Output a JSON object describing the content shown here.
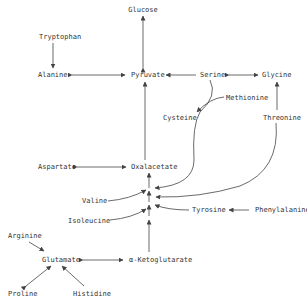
{
  "diagram": {
    "type": "metabolic-pathway",
    "colors": {
      "text": "#333333",
      "line": "#444444",
      "background": "#ffffff"
    },
    "nodes": {
      "glucose": {
        "label": "Glucose",
        "x": 143,
        "y": 6
      },
      "tryptophan": {
        "label": "Tryptophan",
        "x": 39,
        "y": 33
      },
      "alanine": {
        "label": "Alanine",
        "x": 38,
        "y": 71
      },
      "pyruvate": {
        "label": "Pyruvate",
        "x": 131,
        "y": 71
      },
      "serine": {
        "label": "Serine",
        "x": 200,
        "y": 71
      },
      "glycine": {
        "label": "Glycine",
        "x": 262,
        "y": 71
      },
      "methionine": {
        "label": "Methionine",
        "x": 226,
        "y": 94
      },
      "cysteine": {
        "label": "Cysteine",
        "x": 163,
        "y": 114
      },
      "threonine": {
        "label": "Threonine",
        "x": 263,
        "y": 114
      },
      "aspartate": {
        "label": "Aspartate",
        "x": 38,
        "y": 163
      },
      "oxalacetate": {
        "label": "Oxalacetate",
        "x": 131,
        "y": 163
      },
      "valine": {
        "label": "Valine",
        "x": 82,
        "y": 197
      },
      "isoleucine": {
        "label": "Isoleucine",
        "x": 68,
        "y": 217
      },
      "tyrosine": {
        "label": "Tyrosine",
        "x": 192,
        "y": 206
      },
      "phenylalanine": {
        "label": "Phenylalanine",
        "x": 255,
        "y": 206
      },
      "arginine": {
        "label": "Arginine",
        "x": 8,
        "y": 232
      },
      "glutamate": {
        "label": "Glutamate",
        "x": 42,
        "y": 256
      },
      "ketoglutarate": {
        "label": "α-Ketoglutarate",
        "x": 129,
        "y": 256
      },
      "proline": {
        "label": "Proline",
        "x": 8,
        "y": 290
      },
      "histidine": {
        "label": "Histidine",
        "x": 73,
        "y": 290
      }
    },
    "edges": [
      {
        "from": "pyruvate",
        "to": "glucose",
        "bidirectional": true
      },
      {
        "from": "tryptophan",
        "to": "alanine"
      },
      {
        "from": "alanine",
        "to": "pyruvate",
        "bidirectional": true
      },
      {
        "from": "serine",
        "to": "pyruvate"
      },
      {
        "from": "serine",
        "to": "glycine",
        "bidirectional": true
      },
      {
        "from": "methionine",
        "to": "cysteine"
      },
      {
        "from": "serine",
        "to": "oxalacetate-chain"
      },
      {
        "from": "threonine",
        "to": "glycine"
      },
      {
        "from": "threonine",
        "to": "oxalacetate-chain"
      },
      {
        "from": "oxalacetate",
        "to": "pyruvate"
      },
      {
        "from": "aspartate",
        "to": "oxalacetate",
        "bidirectional": true
      },
      {
        "from": "valine",
        "to": "oxalacetate-chain"
      },
      {
        "from": "isoleucine",
        "to": "oxalacetate-chain"
      },
      {
        "from": "tyrosine",
        "to": "oxalacetate-chain"
      },
      {
        "from": "phenylalanine",
        "to": "tyrosine"
      },
      {
        "from": "ketoglutarate",
        "to": "oxalacetate"
      },
      {
        "from": "arginine",
        "to": "glutamate"
      },
      {
        "from": "glutamate",
        "to": "ketoglutarate",
        "bidirectional": true
      },
      {
        "from": "proline",
        "to": "glutamate",
        "bidirectional": true
      },
      {
        "from": "histidine",
        "to": "glutamate"
      }
    ]
  }
}
